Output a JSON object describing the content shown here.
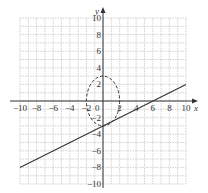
{
  "chart_data": {
    "type": "line",
    "title": "",
    "xlabel": "x",
    "ylabel": "y",
    "xlim": [
      -10,
      10
    ],
    "ylim": [
      -10,
      10
    ],
    "grid": true,
    "grid_step": 1,
    "x_ticks": [
      -10,
      -8,
      -6,
      -4,
      -2,
      0,
      2,
      4,
      6,
      8,
      10
    ],
    "y_ticks": [
      -10,
      -8,
      -6,
      -4,
      -2,
      2,
      4,
      6,
      8,
      10
    ],
    "x_tick_labels": [
      "−10",
      "−8",
      "−6",
      "−4",
      "−2",
      "0",
      "2",
      "4",
      "6",
      "8",
      "10"
    ],
    "y_tick_labels": [
      "−10",
      "−8",
      "−6",
      "−4",
      "−2",
      "2",
      "4",
      "6",
      "8",
      "10"
    ],
    "series": [
      {
        "name": "line",
        "style": "solid",
        "equation": "y = 0.5x - 3",
        "x": [
          -10,
          10
        ],
        "y": [
          -8,
          2
        ]
      },
      {
        "name": "ellipse",
        "style": "dashed",
        "equation": "x^2/4 + y^2/9 = 1",
        "center": [
          0,
          0
        ],
        "rx": 2,
        "ry": 3
      }
    ]
  },
  "colors": {
    "grid": "#c8c8c8",
    "axis": "#333333",
    "curve": "#333333",
    "background": "#ffffff"
  }
}
